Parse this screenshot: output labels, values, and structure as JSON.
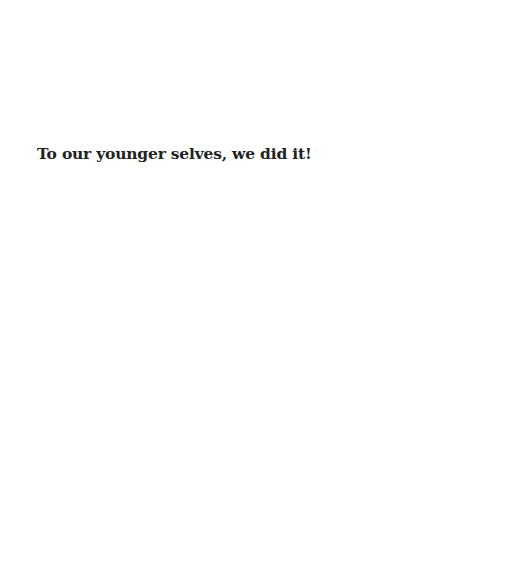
{
  "page": {
    "background_color": "#ffffff",
    "dedication": {
      "text": "To our younger selves, we did it!",
      "color": "#222222"
    }
  }
}
